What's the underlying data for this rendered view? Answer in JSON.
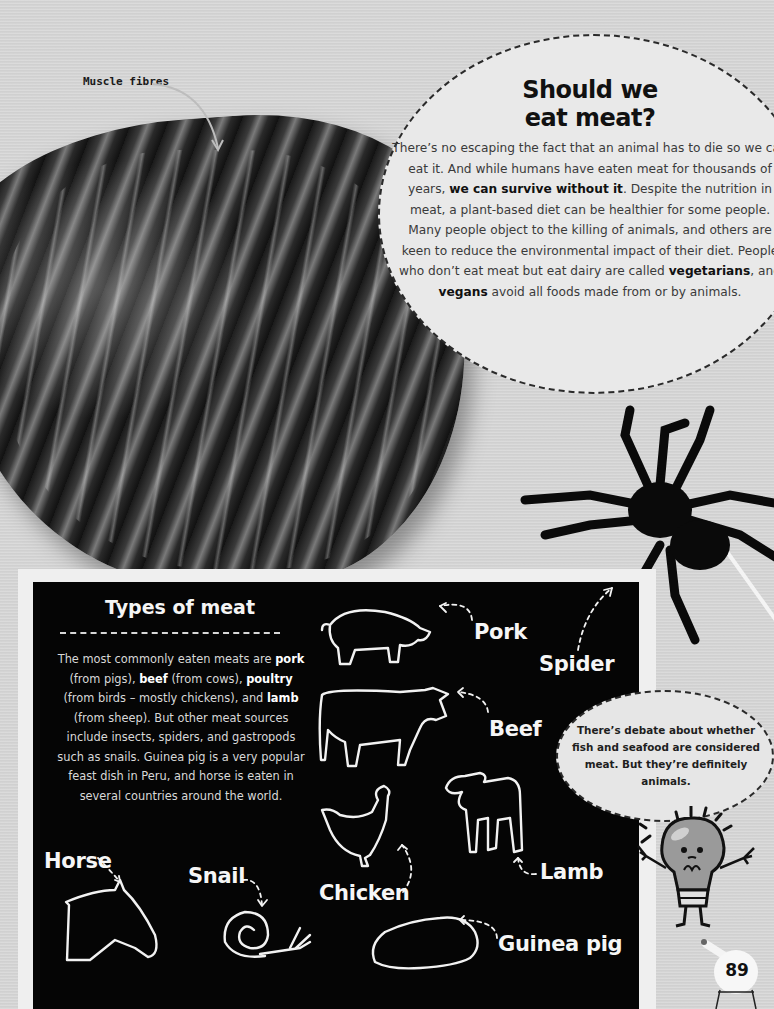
{
  "photo": {
    "label": "Muscle fibres"
  },
  "feature": {
    "title_line1": "Should we",
    "title_line2": "eat meat?",
    "body": [
      {
        "text": "There’s no escaping the fact that an animal has to die so we can eat it. And while humans have eaten meat for thousands of years, ",
        "bold": false
      },
      {
        "text": "we can survive without it",
        "bold": true
      },
      {
        "text": ". Despite the nutrition in meat, a plant-based diet can be healthier for some people. Many people object to the killing of animals, and others are keen to reduce the environmental impact of their diet. People who don’t eat meat but eat dairy are called ",
        "bold": false
      },
      {
        "text": "vegetarians",
        "bold": true
      },
      {
        "text": ", and ",
        "bold": false
      },
      {
        "text": "vegans",
        "bold": true
      },
      {
        "text": " avoid all foods made from or by animals.",
        "bold": false
      }
    ]
  },
  "board": {
    "title": "Types of meat",
    "body": [
      {
        "text": "The most commonly eaten meats are ",
        "bold": false
      },
      {
        "text": "pork",
        "bold": true
      },
      {
        "text": " (from pigs), ",
        "bold": false
      },
      {
        "text": "beef",
        "bold": true
      },
      {
        "text": " (from cows), ",
        "bold": false
      },
      {
        "text": "poultry",
        "bold": true
      },
      {
        "text": " (from birds – mostly chickens), and ",
        "bold": false
      },
      {
        "text": "lamb",
        "bold": true
      },
      {
        "text": " (from sheep). But other meat sources include insects, spiders, and gastropods such as snails. Guinea pig is a very popular feast dish in Peru, and horse is eaten in several countries around the world.",
        "bold": false
      }
    ],
    "labels": {
      "pork": "Pork",
      "spider": "Spider",
      "beef": "Beef",
      "lamb": "Lamb",
      "chicken": "Chicken",
      "horse": "Horse",
      "snail": "Snail",
      "guinea_pig": "Guinea pig"
    }
  },
  "bubble": {
    "text": "There’s debate about whether fish and seafood are considered meat. But they’re definitely animals."
  },
  "page": {
    "number": "89"
  },
  "colors": {
    "background": "#d3d3d3",
    "board": "#050505",
    "circle": "#e9e9e9",
    "chalk": "#f6f6f6"
  }
}
